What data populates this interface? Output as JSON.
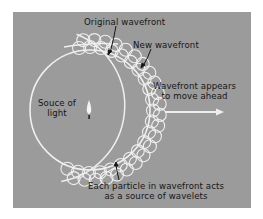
{
  "figure": {
    "labels": {
      "original_wavefront": "Original wavefront",
      "new_wavefront": "New wavefront",
      "wavefront_appears_line1": "Wavefront appears",
      "wavefront_appears_line2": "to move ahead",
      "source_line1": "Souce of",
      "source_line2": "light",
      "particle_line1": "Each particle in wavefront acts",
      "particle_line2": "as a source of wavelets"
    },
    "icons": {
      "light_source": "candle-flame-icon",
      "direction_arrow": "right-arrow-icon"
    },
    "colors": {
      "panel": "#9b9b9b",
      "lines": "#efefef",
      "text": "#161616",
      "page": "#ffffff"
    }
  }
}
